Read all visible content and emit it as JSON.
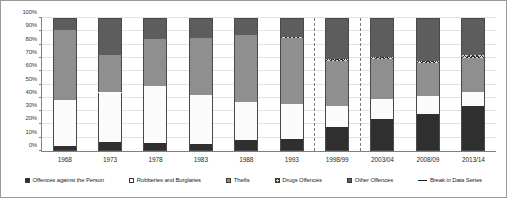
{
  "chart_data": {
    "type": "bar",
    "subtype": "stacked-100-percent",
    "title": "",
    "xlabel": "",
    "ylabel": "",
    "ylim": [
      0,
      100
    ],
    "ytick_labels": [
      "0%",
      "10%",
      "20%",
      "30%",
      "40%",
      "50%",
      "60%",
      "70%",
      "80%",
      "90%",
      "100%"
    ],
    "ytick_values": [
      0,
      10,
      20,
      30,
      40,
      50,
      60,
      70,
      80,
      90,
      100
    ],
    "grid": true,
    "legend_position": "bottom",
    "categories": [
      "1968",
      "1973",
      "1978",
      "1983",
      "1988",
      "1993",
      "1998/99",
      "2003/04",
      "2008/09",
      "2013/14"
    ],
    "series": [
      {
        "name": "Offences against the Person",
        "color": "#2f2f2f",
        "values": [
          4,
          7,
          6,
          5,
          8,
          9,
          18,
          24,
          28,
          34
        ]
      },
      {
        "name": "Robberies and Burglaries",
        "color": "#ffffff",
        "values": [
          34,
          37,
          43,
          37,
          29,
          26,
          16,
          15,
          13,
          10
        ]
      },
      {
        "name": "Thefts",
        "color": "#8f8f8f",
        "values": [
          53,
          28,
          35,
          43,
          50,
          50,
          34,
          30,
          25,
          26
        ]
      },
      {
        "name": "Drugs Offences",
        "color": "#d8d8d8",
        "values": [
          0,
          0,
          0,
          0,
          0,
          1,
          1,
          2,
          2,
          2
        ]
      },
      {
        "name": "Other Offences",
        "color": "#5d5d5d",
        "values": [
          9,
          28,
          16,
          15,
          13,
          14,
          31,
          29,
          32,
          28
        ]
      }
    ],
    "break_in_data_series": {
      "label": "Break in Data Series",
      "after_categories": [
        "1993",
        "1998/99"
      ]
    }
  },
  "legend": {
    "items": [
      {
        "label": "Offences against the Person",
        "swatch": "swatch-person"
      },
      {
        "label": "Robberies and Burglaries",
        "swatch": "swatch-robbery"
      },
      {
        "label": "Thefts",
        "swatch": "swatch-theft"
      },
      {
        "label": "Drugs Offences",
        "swatch": "swatch-drugs"
      },
      {
        "label": "Other Offences",
        "swatch": "swatch-other"
      },
      {
        "label": "Break in Data Series",
        "swatch": "swatch-break"
      }
    ]
  }
}
